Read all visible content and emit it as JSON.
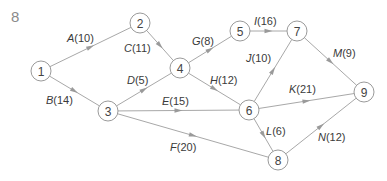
{
  "figure": {
    "number": "8"
  },
  "nodes": [
    {
      "id": "1",
      "x": 41,
      "y": 71
    },
    {
      "id": "2",
      "x": 140,
      "y": 23
    },
    {
      "id": "3",
      "x": 108,
      "y": 111
    },
    {
      "id": "4",
      "x": 180,
      "y": 68
    },
    {
      "id": "5",
      "x": 240,
      "y": 31
    },
    {
      "id": "6",
      "x": 249,
      "y": 110
    },
    {
      "id": "7",
      "x": 297,
      "y": 31
    },
    {
      "id": "8",
      "x": 278,
      "y": 160
    },
    {
      "id": "9",
      "x": 364,
      "y": 92
    }
  ],
  "edges": [
    {
      "activity": "A",
      "duration": "(10)",
      "from": "1",
      "to": "2",
      "lx": 67,
      "ly": 42
    },
    {
      "activity": "B",
      "duration": "(14)",
      "from": "1",
      "to": "3",
      "lx": 46,
      "ly": 104
    },
    {
      "activity": "C",
      "duration": "(11)",
      "from": "2",
      "to": "4",
      "lx": 124,
      "ly": 52
    },
    {
      "activity": "D",
      "duration": "(5)",
      "from": "3",
      "to": "4",
      "lx": 127,
      "ly": 84
    },
    {
      "activity": "E",
      "duration": "(15)",
      "from": "3",
      "to": "6",
      "lx": 162,
      "ly": 105
    },
    {
      "activity": "F",
      "duration": "(20)",
      "from": "3",
      "to": "8",
      "lx": 170,
      "ly": 151
    },
    {
      "activity": "G",
      "duration": "(8)",
      "from": "4",
      "to": "5",
      "lx": 192,
      "ly": 45
    },
    {
      "activity": "H",
      "duration": "(12)",
      "from": "4",
      "to": "6",
      "lx": 210,
      "ly": 84
    },
    {
      "activity": "I",
      "duration": "(16)",
      "from": "5",
      "to": "7",
      "lx": 254,
      "ly": 25
    },
    {
      "activity": "J",
      "duration": "(10)",
      "from": "6",
      "to": "7",
      "lx": 246,
      "ly": 62
    },
    {
      "activity": "K",
      "duration": "(21)",
      "from": "6",
      "to": "9",
      "lx": 289,
      "ly": 93
    },
    {
      "activity": "L",
      "duration": "(6)",
      "from": "6",
      "to": "8",
      "lx": 266,
      "ly": 135
    },
    {
      "activity": "M",
      "duration": "(9)",
      "from": "7",
      "to": "9",
      "lx": 333,
      "ly": 57
    },
    {
      "activity": "N",
      "duration": "(12)",
      "from": "8",
      "to": "9",
      "lx": 318,
      "ly": 141
    }
  ]
}
